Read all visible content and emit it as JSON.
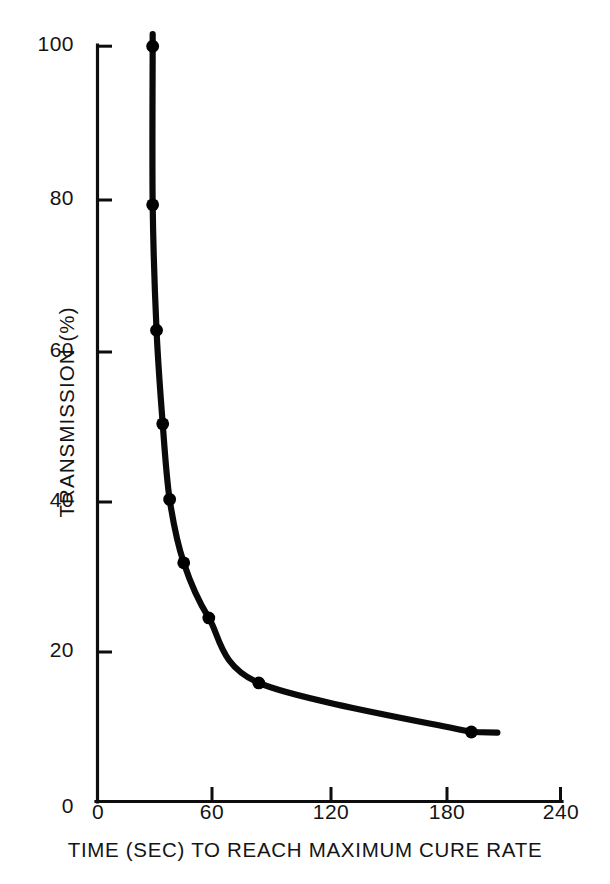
{
  "chart_data": {
    "type": "line",
    "title": "",
    "subtitle": "",
    "xlabel": "TIME (SEC) TO REACH MAXIMUM CURE RATE",
    "ylabel": "TRANSMISSION (%)",
    "xlim": [
      0,
      240
    ],
    "ylim": [
      0,
      100
    ],
    "xticks": [
      0,
      60,
      120,
      180,
      240
    ],
    "xtick_labels": [
      "0",
      "60",
      "120",
      "180",
      "240"
    ],
    "yticks": [
      0,
      20,
      40,
      60,
      80,
      100
    ],
    "ytick_labels": [
      "0",
      "20",
      "40",
      "60",
      "80",
      "100"
    ],
    "grid": false,
    "legend": null,
    "legend_position": "none",
    "line_color": "#000000",
    "marker": "filled-circle",
    "marker_color": "#000000",
    "x": [
      28.6,
      28.6,
      30.6,
      33.8,
      37.4,
      44.7,
      57.7,
      83.6,
      193.8
    ],
    "y": [
      100,
      79,
      62.4,
      50,
      40,
      31.6,
      24.3,
      15.7,
      9.2
    ],
    "series": [
      {
        "name": "transmission vs cure time",
        "points": [
          {
            "x": 28.6,
            "y": 100
          },
          {
            "x": 28.6,
            "y": 79
          },
          {
            "x": 30.6,
            "y": 62.4
          },
          {
            "x": 33.8,
            "y": 50
          },
          {
            "x": 37.4,
            "y": 40
          },
          {
            "x": 44.7,
            "y": 31.6
          },
          {
            "x": 57.7,
            "y": 24.3
          },
          {
            "x": 83.6,
            "y": 15.7
          },
          {
            "x": 193.8,
            "y": 9.2
          }
        ]
      }
    ],
    "annotations": []
  },
  "axes": {
    "y_title": "TRANSMISSION (%)",
    "x_title": "TIME (SEC) TO REACH MAXIMUM CURE RATE",
    "y_tick_labels": [
      "100",
      "80",
      "60",
      "40",
      "20",
      "0"
    ],
    "x_tick_labels": [
      "0",
      "60",
      "120",
      "180",
      "240"
    ]
  }
}
